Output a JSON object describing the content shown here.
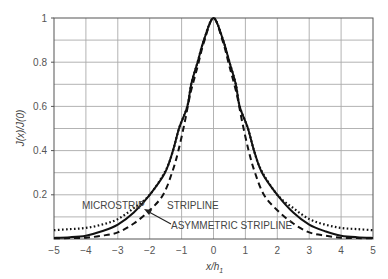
{
  "chart_data": {
    "type": "line",
    "title": "",
    "xlabel": "x/h1",
    "ylabel": "J(x)/J(0)",
    "xlim": [
      -5,
      5
    ],
    "ylim": [
      0,
      1
    ],
    "grid": true,
    "x_ticks": [
      "-5",
      "-4",
      "-3",
      "-2",
      "-1",
      "0",
      "1",
      "2",
      "3",
      "4",
      "5"
    ],
    "y_ticks": [
      "0.2",
      "0.4",
      "0.6",
      "0.8",
      "1"
    ],
    "legend": "inline annotations",
    "annotations": [
      {
        "text": "MICROSTRIP",
        "x": -4.1,
        "y": 0.14
      },
      {
        "text": "STRIPLINE",
        "x": -1.45,
        "y": 0.14
      },
      {
        "text": "ASYMMETRIC STRIPLINE",
        "x": -1.3,
        "y": 0.05,
        "arrow_to": [
          -2.1,
          0.12
        ]
      }
    ],
    "series": [
      {
        "name": "MICROSTRIP",
        "style": "dotted",
        "x": [
          -5,
          -4.5,
          -4,
          -3.5,
          -3,
          -2.5,
          -2,
          -1.5,
          -1.27,
          -1.08,
          -0.82,
          -0.7,
          -0.5,
          -0.3,
          0,
          0.3,
          0.5,
          0.7,
          0.82,
          1.08,
          1.27,
          1.5,
          2,
          2.5,
          3,
          3.5,
          4,
          4.5,
          5
        ],
        "values": [
          0.04,
          0.045,
          0.05,
          0.065,
          0.09,
          0.14,
          0.2,
          0.31,
          0.4,
          0.5,
          0.6,
          0.7,
          0.8,
          0.9,
          1,
          0.9,
          0.8,
          0.7,
          0.6,
          0.5,
          0.4,
          0.31,
          0.2,
          0.14,
          0.09,
          0.065,
          0.05,
          0.045,
          0.04
        ]
      },
      {
        "name": "STRIPLINE",
        "style": "solid",
        "x": [
          -5,
          -4.5,
          -4,
          -3.5,
          -3,
          -2.5,
          -2,
          -1.52,
          -1.27,
          -1.08,
          -0.82,
          -0.7,
          -0.5,
          -0.3,
          0,
          0.3,
          0.5,
          0.7,
          0.82,
          1.08,
          1.27,
          1.52,
          2,
          2.5,
          3,
          3.5,
          4,
          4.5,
          5
        ],
        "values": [
          0.005,
          0.008,
          0.015,
          0.035,
          0.065,
          0.12,
          0.2,
          0.3,
          0.4,
          0.5,
          0.6,
          0.7,
          0.8,
          0.9,
          1,
          0.9,
          0.8,
          0.7,
          0.6,
          0.5,
          0.4,
          0.3,
          0.2,
          0.12,
          0.065,
          0.035,
          0.015,
          0.008,
          0.005
        ]
      },
      {
        "name": "ASYMMETRIC STRIPLINE",
        "style": "dashed",
        "x": [
          -5,
          -4.5,
          -4,
          -3.5,
          -3,
          -2.5,
          -2,
          -1.58,
          -1.3,
          -1.1,
          -0.9,
          -0.72,
          -0.5,
          -0.3,
          0,
          0.3,
          0.5,
          0.72,
          0.9,
          1.1,
          1.3,
          1.58,
          2,
          2.5,
          3,
          3.5,
          4,
          4.5,
          5
        ],
        "values": [
          0.003,
          0.004,
          0.006,
          0.015,
          0.03,
          0.07,
          0.13,
          0.2,
          0.3,
          0.4,
          0.53,
          0.66,
          0.78,
          0.89,
          1,
          0.89,
          0.78,
          0.66,
          0.53,
          0.4,
          0.3,
          0.2,
          0.13,
          0.07,
          0.03,
          0.015,
          0.006,
          0.004,
          0.003
        ]
      }
    ]
  },
  "labels": {
    "microstrip": "MICROSTRIP",
    "stripline": "STRIPLINE",
    "asymmetric": "ASYMMETRIC STRIPLINE",
    "xlabel_main": "x/h",
    "xlabel_sub": "1",
    "ylabel": "J(x)/J(0)"
  }
}
